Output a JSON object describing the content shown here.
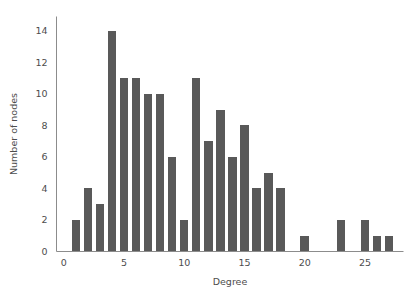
{
  "chart_data": {
    "type": "bar",
    "title": "",
    "subtitle": "",
    "xlabel": "Degree",
    "ylabel": "Number of nodes",
    "categories": [
      1,
      2,
      3,
      4,
      5,
      6,
      7,
      8,
      9,
      10,
      11,
      12,
      13,
      14,
      15,
      16,
      17,
      18,
      19,
      20,
      21,
      22,
      23,
      24,
      25,
      26,
      27
    ],
    "values": [
      2,
      4,
      3,
      14,
      11,
      11,
      10,
      10,
      6,
      2,
      11,
      7,
      9,
      6,
      8,
      4,
      5,
      4,
      0,
      1,
      0,
      0,
      2,
      0,
      2,
      1,
      1
    ],
    "xlim": [
      -0.6,
      28.2
    ],
    "ylim": [
      0,
      14.9
    ],
    "xticks": [
      0,
      5,
      10,
      15,
      20,
      25
    ],
    "xtick_labels": [
      "0",
      "5",
      "10",
      "15",
      "20",
      "25"
    ],
    "yticks": [
      0,
      2,
      4,
      6,
      8,
      10,
      12,
      14
    ],
    "ytick_labels": [
      "0",
      "2",
      "4",
      "6",
      "8",
      "10",
      "12",
      "14"
    ],
    "grid": false,
    "legend": null,
    "bar_color": "#595959",
    "axis_color": "#8c8c8c",
    "text_color": "#4d4d4d",
    "background": "#ffffff",
    "annotations": []
  }
}
